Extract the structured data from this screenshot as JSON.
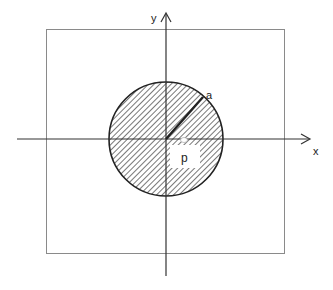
{
  "diagram": {
    "type": "geometry",
    "labels": {
      "x_axis": "x",
      "y_axis": "y",
      "radius": "a",
      "point": "p"
    },
    "colors": {
      "stroke": "#222222",
      "frame": "#8a8a8a",
      "axis": "#333333",
      "hatch": "#555555",
      "background": "#ffffff"
    },
    "geometry": {
      "frame": {
        "x": 46,
        "y": 29,
        "width": 238,
        "height": 224
      },
      "origin": {
        "x": 166,
        "y": 139
      },
      "circle_radius": 57,
      "x_axis": {
        "x1": 17,
        "x2": 309,
        "y": 139
      },
      "y_axis": {
        "x": 166,
        "y1": 276,
        "y2": 15
      },
      "radius_line_end": {
        "x": 203,
        "y": 97
      },
      "point_box": {
        "x": 170,
        "y": 145,
        "width": 30,
        "height": 23
      }
    }
  }
}
